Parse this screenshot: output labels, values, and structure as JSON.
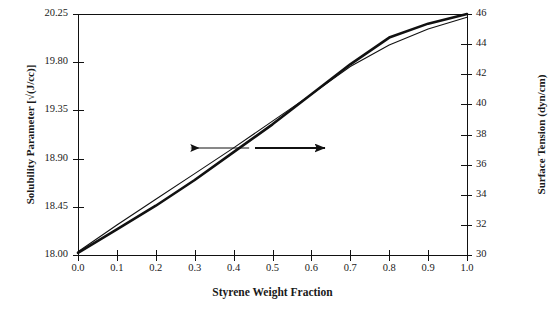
{
  "chart_data": {
    "type": "line",
    "title": "",
    "xlabel": "Styrene Weight Fraction",
    "ylabel": "Solubility Parameter [√(J/cc)]",
    "y2label": "Surface Tension (dyn/cm)",
    "xlim": [
      0.0,
      1.0
    ],
    "ylim": [
      18.0,
      20.25
    ],
    "y2lim": [
      30,
      46
    ],
    "grid": false,
    "legend": null,
    "xticks": [
      "0.0",
      "0.1",
      "0.2",
      "0.3",
      "0.4",
      "0.5",
      "0.6",
      "0.7",
      "0.8",
      "0.9",
      "1.0"
    ],
    "xtick_values": [
      0.0,
      0.1,
      0.2,
      0.3,
      0.4,
      0.5,
      0.6,
      0.7,
      0.8,
      0.9,
      1.0
    ],
    "yticks": [
      "18.00",
      "18.45",
      "18.90",
      "19.35",
      "19.80",
      "20.25"
    ],
    "ytick_values": [
      18.0,
      18.45,
      18.9,
      19.35,
      19.8,
      20.25
    ],
    "y2ticks": [
      "30",
      "32",
      "34",
      "36",
      "38",
      "40",
      "42",
      "44",
      "46"
    ],
    "y2tick_values": [
      30,
      32,
      34,
      36,
      38,
      40,
      42,
      44,
      46
    ],
    "x": [
      0.0,
      0.1,
      0.2,
      0.3,
      0.4,
      0.5,
      0.6,
      0.7,
      0.8,
      0.9,
      1.0
    ],
    "series": [
      {
        "name": "Solubility Parameter",
        "axis": "right",
        "style": "thick-solid",
        "color": "#111111",
        "linewidth": 2.6,
        "values": [
          18.02,
          18.24,
          18.46,
          18.7,
          18.96,
          19.22,
          19.5,
          19.78,
          20.03,
          20.16,
          20.25
        ]
      },
      {
        "name": "Surface Tension",
        "axis": "left",
        "style": "thin-solid",
        "color": "#111111",
        "linewidth": 1.1,
        "values": [
          18.03,
          18.28,
          18.52,
          18.76,
          19.0,
          19.25,
          19.5,
          19.76,
          19.96,
          20.11,
          20.22
        ]
      }
    ],
    "annotations": [
      {
        "name": "left-pointing-arrow",
        "kind": "arrow",
        "direction": "left",
        "weight": "thin",
        "x_start": 0.44,
        "x_end": 0.29,
        "y_pixel": 148
      },
      {
        "name": "right-pointing-arrow",
        "kind": "arrow",
        "direction": "right",
        "weight": "thick",
        "x_start": 0.455,
        "x_end": 0.635,
        "y_pixel": 148
      }
    ]
  },
  "figure": {
    "background": "#ffffff",
    "axis_color": "#111111",
    "text_color": "#1a1a1a"
  }
}
